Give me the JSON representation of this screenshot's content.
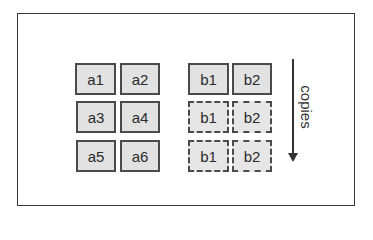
{
  "diagram": {
    "group_a": {
      "cells": [
        {
          "label": "a1"
        },
        {
          "label": "a2"
        },
        {
          "label": "a3"
        },
        {
          "label": "a4"
        },
        {
          "label": "a5"
        },
        {
          "label": "a6"
        }
      ]
    },
    "group_b": {
      "original": [
        {
          "label": "b1"
        },
        {
          "label": "b2"
        }
      ],
      "copies": [
        [
          {
            "label": "b1"
          },
          {
            "label": "b2"
          }
        ],
        [
          {
            "label": "b1"
          },
          {
            "label": "b2"
          }
        ]
      ]
    },
    "arrow_label": "copies",
    "colors": {
      "cell_fill": "#e2e2e2",
      "border": "#4a4a4a"
    }
  }
}
